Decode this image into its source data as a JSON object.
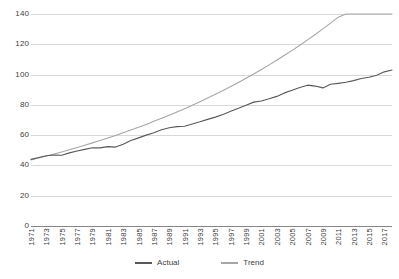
{
  "chart_data": {
    "type": "line",
    "title": "",
    "xlabel": "",
    "ylabel": "",
    "ylim": [
      0,
      140
    ],
    "ytick_values": [
      140,
      120,
      100,
      80,
      60,
      40,
      20,
      0
    ],
    "ytick_labels": [
      "140",
      "120",
      "100",
      "80",
      "60",
      "40",
      "20",
      "0"
    ],
    "grid": true,
    "legend_position": "bottom-center",
    "x": [
      1971,
      1972,
      1973,
      1974,
      1975,
      1976,
      1977,
      1978,
      1979,
      1980,
      1981,
      1982,
      1983,
      1984,
      1985,
      1986,
      1987,
      1988,
      1989,
      1990,
      1991,
      1992,
      1993,
      1994,
      1995,
      1996,
      1997,
      1998,
      1999,
      2000,
      2001,
      2002,
      2003,
      2004,
      2005,
      2006,
      2007,
      2008,
      2009,
      2010,
      2011,
      2012,
      2013,
      2014,
      2015,
      2016,
      2017,
      2018
    ],
    "xtick_labels": [
      "1971",
      "1973",
      "1975",
      "1977",
      "1979",
      "1981",
      "1983",
      "1985",
      "1987",
      "1989",
      "1991",
      "1993",
      "1995",
      "1997",
      "1999",
      "2001",
      "2003",
      "2005",
      "2007",
      "2009",
      "2011",
      "2013",
      "2015",
      "2017"
    ],
    "series": [
      {
        "name": "Actual",
        "color": "#595959",
        "values": [
          44.0,
          45.2,
          46.4,
          46.9,
          46.7,
          48.3,
          49.5,
          50.6,
          51.7,
          51.6,
          52.4,
          52.1,
          54.0,
          56.4,
          58.2,
          60.0,
          61.6,
          63.6,
          64.9,
          65.6,
          65.9,
          67.4,
          68.8,
          70.4,
          71.9,
          73.7,
          75.8,
          77.7,
          79.8,
          81.8,
          82.6,
          84.0,
          85.6,
          87.9,
          89.6,
          91.4,
          93.0,
          92.4,
          91.2,
          93.6,
          94.2,
          94.9,
          96.0,
          97.4,
          98.2,
          99.6,
          101.8,
          103.0
        ]
      },
      {
        "name": "Trend",
        "color": "#a6a6a6",
        "values": [
          43.6,
          44.9,
          46.2,
          47.5,
          48.9,
          50.3,
          51.8,
          53.3,
          54.9,
          56.5,
          58.1,
          59.8,
          61.6,
          63.4,
          65.2,
          67.1,
          69.1,
          71.1,
          73.2,
          75.3,
          77.5,
          79.8,
          82.1,
          84.5,
          87.0,
          89.5,
          92.1,
          94.8,
          97.6,
          100.4,
          103.4,
          106.4,
          109.5,
          112.7,
          116.0,
          119.4,
          122.9,
          126.5,
          130.2,
          134.0,
          137.9,
          141.9,
          146.0,
          150.2,
          154.6,
          159.1,
          163.7,
          168.4
        ]
      }
    ]
  }
}
